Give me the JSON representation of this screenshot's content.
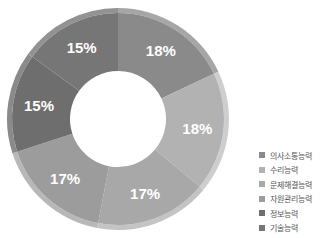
{
  "chart_data": {
    "type": "pie",
    "subtype": "donut",
    "title": "",
    "categories": [
      "의사소통능력",
      "수리능력",
      "문제해결능력",
      "자원관리능력",
      "정보능력",
      "기술능력"
    ],
    "values": [
      18,
      18,
      17,
      17,
      15,
      15
    ],
    "labels": [
      "18%",
      "18%",
      "17%",
      "17%",
      "15%",
      "15%"
    ],
    "colors": [
      "#8a8a8a",
      "#b2b2b2",
      "#a8a8a8",
      "#9c9c9c",
      "#6e6e6e",
      "#767676"
    ],
    "legend_position": "right",
    "start_angle": "top",
    "direction": "clockwise"
  },
  "legend": [
    {
      "label": "의사소통능력",
      "color": "#8a8a8a"
    },
    {
      "label": "수리능력",
      "color": "#b2b2b2"
    },
    {
      "label": "문제해결능력",
      "color": "#a8a8a8"
    },
    {
      "label": "자원관리능력",
      "color": "#9c9c9c"
    },
    {
      "label": "정보능력",
      "color": "#6e6e6e"
    },
    {
      "label": "기술능력",
      "color": "#767676"
    }
  ]
}
